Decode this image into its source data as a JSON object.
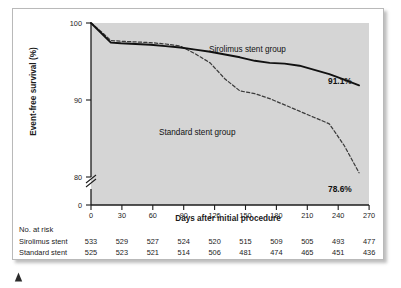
{
  "figure": {
    "background_color": "#ffffff",
    "panel_border_color": "#b9b9b9",
    "plot_background_color": "#d5d5d5",
    "axis_color": "#1b1b1b",
    "sirolimus_color": "#111111",
    "standard_color": "#3b3b3b",
    "bottom_marker_name": "caret-marker"
  },
  "chart_data": {
    "type": "line",
    "title": "",
    "subtitle": "",
    "xlabel": "Days after initial procedure",
    "ylabel": "Event-free survival (%)",
    "xlim": [
      0,
      280
    ],
    "ylim": [
      78,
      100
    ],
    "grid": false,
    "legend_position": "inline-annotations",
    "y_axis_break": true,
    "y_axis_break_label": "0",
    "x_ticks": [
      0,
      30,
      60,
      90,
      120,
      150,
      180,
      210,
      240,
      270
    ],
    "x_tick_labels": [
      "0",
      "30",
      "60",
      "90",
      "120",
      "150",
      "180",
      "210",
      "240",
      "270"
    ],
    "y_ticks": [
      80,
      90,
      100
    ],
    "y_tick_labels": [
      "80",
      "90",
      "100"
    ],
    "x": [
      0,
      10,
      20,
      30,
      45,
      60,
      75,
      90,
      105,
      120,
      135,
      150,
      165,
      180,
      195,
      210,
      225,
      240,
      255,
      270
    ],
    "series": [
      {
        "name": "Sirolimus stent group",
        "style": "solid",
        "annotation": "Sirolimus stent group",
        "endpoint_label": "91.1%",
        "endpoint_value": 91.1,
        "values": [
          100.0,
          98.6,
          97.2,
          97.1,
          97.0,
          96.9,
          96.7,
          96.5,
          96.2,
          95.9,
          95.5,
          95.1,
          94.6,
          94.3,
          94.2,
          93.9,
          93.3,
          92.7,
          91.9,
          91.1
        ]
      },
      {
        "name": "Standard stent group",
        "style": "dashed",
        "annotation": "Standard stent group",
        "endpoint_label": "78.6%",
        "endpoint_value": 78.6,
        "values": [
          100.0,
          98.8,
          97.5,
          97.4,
          97.3,
          97.2,
          97.0,
          96.7,
          95.6,
          94.3,
          92.0,
          90.3,
          89.9,
          89.2,
          88.3,
          87.4,
          86.5,
          85.6,
          82.5,
          78.6
        ]
      }
    ],
    "annotations": [
      {
        "text": "Sirolimus stent group",
        "series": "Sirolimus stent group"
      },
      {
        "text": "Standard stent group",
        "series": "Standard stent group"
      },
      {
        "text": "91.1%",
        "series": "Sirolimus stent group"
      },
      {
        "text": "78.6%",
        "series": "Standard stent group"
      }
    ]
  },
  "risk_table": {
    "title": "No. at risk",
    "columns": [
      "0",
      "30",
      "60",
      "90",
      "120",
      "150",
      "180",
      "210",
      "240",
      "270"
    ],
    "rows": [
      {
        "label": "Sirolimus stent",
        "values": [
          "533",
          "529",
          "527",
          "524",
          "520",
          "515",
          "509",
          "505",
          "493",
          "477"
        ]
      },
      {
        "label": "Standard stent",
        "values": [
          "525",
          "523",
          "521",
          "514",
          "506",
          "481",
          "474",
          "465",
          "451",
          "436"
        ]
      }
    ]
  }
}
